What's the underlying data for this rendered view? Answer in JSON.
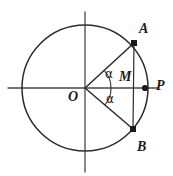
{
  "figure": {
    "kind": "geometry-diagram",
    "width": 173,
    "height": 176,
    "background_color": "#ffffff",
    "stroke_color": "#2b2b2b",
    "axis_color": "#4a4a4a",
    "label_color": "#1a1a1a"
  },
  "circle": {
    "center_x": 85,
    "center_y": 88,
    "radius": 63,
    "stroke_width": 1.4
  },
  "axes": {
    "horizontal": {
      "x1": 8,
      "y1": 88,
      "x2": 158,
      "y2": 88
    },
    "vertical": {
      "x1": 85,
      "y1": 12,
      "x2": 85,
      "y2": 172
    }
  },
  "points": [
    {
      "id": "O",
      "label": "O",
      "x": 85,
      "y": 88,
      "label_x": 68,
      "label_y": 90,
      "dot": false
    },
    {
      "id": "A",
      "label": "A",
      "x": 134,
      "y": 43,
      "label_x": 139,
      "label_y": 22,
      "dot": true
    },
    {
      "id": "B",
      "label": "B",
      "x": 133,
      "y": 129,
      "label_x": 137,
      "label_y": 143,
      "dot": true
    },
    {
      "id": "M",
      "label": "M",
      "x": 134,
      "y": 88,
      "label_x": 119,
      "label_y": 71,
      "dot": false
    },
    {
      "id": "P",
      "label": "P",
      "x": 145,
      "y": 88,
      "label_x": 156,
      "label_y": 78,
      "dot": true
    }
  ],
  "segments": [
    {
      "id": "OA",
      "from": "O",
      "to": "A",
      "x1": 85,
      "y1": 88,
      "x2": 134,
      "y2": 43
    },
    {
      "id": "OB",
      "from": "O",
      "to": "B",
      "x1": 85,
      "y1": 88,
      "x2": 133,
      "y2": 129
    },
    {
      "id": "AB",
      "from": "A",
      "to": "B",
      "x1": 134,
      "y1": 43,
      "x2": 133,
      "y2": 129
    }
  ],
  "angles": [
    {
      "id": "angle-upper",
      "label": "α",
      "vertex": "O",
      "between": "OA and positive x-axis",
      "label_x": 104,
      "label_y": 70,
      "arc_radius": 26,
      "start_deg": 0,
      "end_deg": -42
    },
    {
      "id": "angle-lower",
      "label": "α",
      "vertex": "O",
      "between": "positive x-axis and OB",
      "label_x": 105,
      "label_y": 94,
      "arc_radius": 26,
      "start_deg": 0,
      "end_deg": 40
    }
  ],
  "labels": {
    "O": "O",
    "A": "A",
    "B": "B",
    "M": "M",
    "P": "P",
    "alpha_upper": "α",
    "alpha_lower": "α"
  }
}
